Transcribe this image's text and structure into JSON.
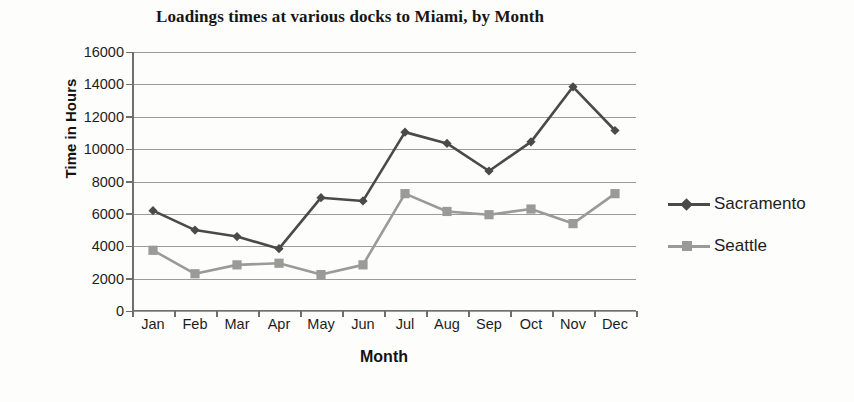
{
  "chart_data": {
    "type": "line",
    "title": "Loadings times at various docks to Miami, by Month",
    "xlabel": "Month",
    "ylabel": "Time in Hours",
    "categories": [
      "Jan",
      "Feb",
      "Mar",
      "Apr",
      "May",
      "Jun",
      "Jul",
      "Aug",
      "Sep",
      "Oct",
      "Nov",
      "Dec"
    ],
    "ylim": [
      0,
      16000
    ],
    "ytick_labels": [
      "16000",
      "14000",
      "12000",
      "10000",
      "8000",
      "6000",
      "4000",
      "2000",
      "0"
    ],
    "ytick_values": [
      16000,
      14000,
      12000,
      10000,
      8000,
      6000,
      4000,
      2000,
      0
    ],
    "grid": true,
    "legend_position": "right",
    "series": [
      {
        "name": "Sacramento",
        "color": "#4a4a48",
        "marker": "diamond",
        "values": [
          6200,
          5000,
          4600,
          3850,
          7000,
          6800,
          11050,
          10350,
          8650,
          10450,
          13850,
          11150
        ]
      },
      {
        "name": "Seattle",
        "color": "#9a9a96",
        "marker": "square",
        "values": [
          3750,
          2300,
          2850,
          2950,
          2250,
          2850,
          7250,
          6150,
          5950,
          6300,
          5400,
          7250
        ]
      }
    ]
  },
  "legend": {
    "items": [
      {
        "label": "Sacramento"
      },
      {
        "label": "Seattle"
      }
    ]
  }
}
